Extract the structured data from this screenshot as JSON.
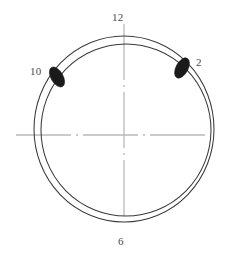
{
  "figure": {
    "kind": "circular-cross-section-roundness-plot",
    "background_color": "#ffffff",
    "center": {
      "x": 124,
      "y": 135
    }
  },
  "axes": {
    "line_color": "#b9b9b9",
    "line_style": "dash-dot",
    "vertical": {
      "x": 124,
      "y_top": 24,
      "y_bottom": 243
    },
    "horizontal": {
      "y": 135,
      "x_left": 16,
      "x_right": 233
    }
  },
  "circles": {
    "stroke_color": "#3a3a3a",
    "outer": {
      "cx": 124,
      "cy": 129,
      "rx": 90,
      "ry": 93
    },
    "inner": {
      "cx": 126,
      "cy": 130,
      "rx": 85,
      "ry": 86
    }
  },
  "clock_labels": [
    {
      "id": "label-12",
      "text": "12",
      "position": "top"
    },
    {
      "id": "label-2",
      "text": "2",
      "position": "upper-right"
    },
    {
      "id": "label-6",
      "text": "6",
      "position": "bottom"
    },
    {
      "id": "label-10",
      "text": "10",
      "position": "upper-left"
    }
  ],
  "marks": {
    "fill_color": "#1a1a1a",
    "items": [
      {
        "name": "mark-2-oclock",
        "clock_position": "2",
        "cx": 182,
        "cy": 68,
        "rx": 6,
        "ry": 11,
        "rotation_deg": 28
      },
      {
        "name": "mark-10-oclock",
        "clock_position": "10",
        "cx": 57,
        "cy": 77,
        "rx": 6,
        "ry": 11,
        "rotation_deg": -30
      }
    ]
  }
}
